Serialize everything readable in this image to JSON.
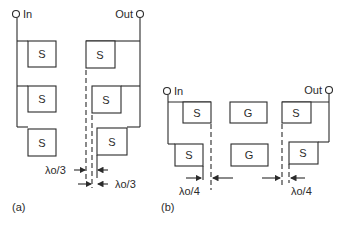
{
  "figure": {
    "panel_a": {
      "caption": "(a)",
      "input_label": "In",
      "output_label": "Out",
      "input_boxes": [
        "S",
        "S",
        "S"
      ],
      "output_boxes": [
        "S",
        "S",
        "S"
      ],
      "dimension_labels": [
        "λo/3",
        "λo/3"
      ]
    },
    "panel_b": {
      "caption": "(b)",
      "input_label": "In",
      "output_label": "Out",
      "input_boxes": [
        "S",
        "S"
      ],
      "gap_boxes": [
        "G",
        "G"
      ],
      "output_boxes": [
        "S",
        "S"
      ],
      "dimension_labels": [
        "λo/4",
        "λo/4"
      ]
    }
  }
}
